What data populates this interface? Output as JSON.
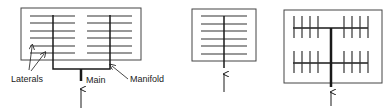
{
  "figure": {
    "panels": [
      {
        "id": "manifold-layout",
        "description": "Two manifolds with laterals fed by a single main"
      },
      {
        "id": "single-header-layout",
        "description": "Single central header with six laterals"
      },
      {
        "id": "double-header-layout",
        "description": "Central main with two cross headers and vertical laterals"
      }
    ],
    "labels": {
      "laterals": "Laterals",
      "main": "Main",
      "manifold": "Manifold"
    },
    "colors": {
      "line": "#1a1a1a",
      "lateral": "#333333",
      "border": "#444444",
      "background": "#ffffff"
    }
  }
}
